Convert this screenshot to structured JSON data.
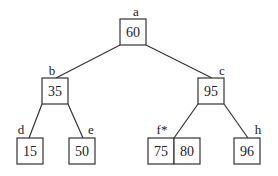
{
  "diagram": {
    "type": "tree",
    "nodes": {
      "a": {
        "label": "a",
        "values": [
          "60"
        ]
      },
      "b": {
        "label": "b",
        "values": [
          "35"
        ]
      },
      "c": {
        "label": "c",
        "values": [
          "95"
        ]
      },
      "d": {
        "label": "d",
        "values": [
          "15"
        ]
      },
      "e": {
        "label": "e",
        "values": [
          "50"
        ]
      },
      "f": {
        "label": "f*",
        "values": [
          "75",
          "80"
        ]
      },
      "h": {
        "label": "h",
        "values": [
          "96"
        ]
      }
    },
    "edges": [
      [
        "a",
        "b"
      ],
      [
        "a",
        "c"
      ],
      [
        "b",
        "d"
      ],
      [
        "b",
        "e"
      ],
      [
        "c",
        "f"
      ],
      [
        "c",
        "h"
      ]
    ],
    "colors": {
      "stroke": "#333333",
      "text": "#222222",
      "background": "#ffffff"
    }
  }
}
